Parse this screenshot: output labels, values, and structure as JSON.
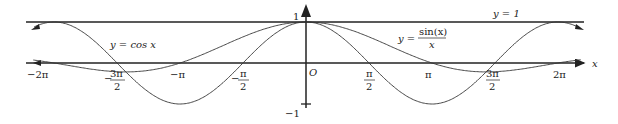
{
  "diagram": {
    "colors": {
      "axis": "#222222",
      "curve": "#333333",
      "background": "#ffffff"
    },
    "axes": {
      "x_label": "x",
      "origin_label": "O",
      "y_tick_top": "1",
      "y_tick_bottom": "−1"
    },
    "x_ticks": {
      "neg_2pi": "−2π",
      "neg_3pi2_num": "3π",
      "neg_3pi2_den": "2",
      "neg_3pi2_sign": "−",
      "neg_pi": "−π",
      "neg_pi2_num": "π",
      "neg_pi2_den": "2",
      "neg_pi2_sign": "−",
      "pi2_num": "π",
      "pi2_den": "2",
      "pi": "π",
      "pi32_num": "3π",
      "pi32_den": "2",
      "two_pi": "2π"
    },
    "curve_labels": {
      "cos": "y = cos x",
      "sinc_lhs": "y =",
      "sinc_num": "sin(x)",
      "sinc_den": "x",
      "line_y1": "y = 1"
    }
  },
  "chart_data": {
    "type": "line",
    "title": "",
    "xlabel": "x",
    "ylabel": "",
    "xlim": [
      -6.5,
      6.9
    ],
    "ylim": [
      -1.1,
      1.1
    ],
    "x_ticks": [
      "−2π",
      "−3π/2",
      "−π",
      "−π/2",
      "O",
      "π/2",
      "π",
      "3π/2",
      "2π"
    ],
    "y_ticks": [
      "1",
      "−1"
    ],
    "series": [
      {
        "name": "y = cos x",
        "function": "cos(x)",
        "domain": [
          -6.28,
          6.28
        ]
      },
      {
        "name": "y = sin(x)/x",
        "function": "sin(x)/x",
        "domain": [
          -6.5,
          6.5
        ]
      },
      {
        "name": "y = 1",
        "function": "1",
        "domain": [
          -6.5,
          6.5
        ]
      }
    ],
    "grid": false,
    "legend": "inline labels"
  }
}
